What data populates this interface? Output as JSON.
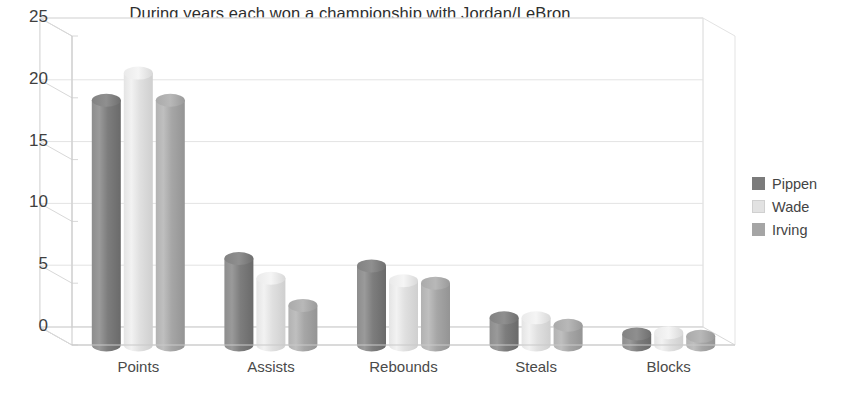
{
  "chart_data": {
    "type": "bar",
    "subtype": "3d-cylinder-clustered",
    "title": "During years each won a championship with Jordan/LeBron",
    "xlabel": "",
    "ylabel": "",
    "categories": [
      "Points",
      "Assists",
      "Rebounds",
      "Steals",
      "Blocks"
    ],
    "series": [
      {
        "name": "Pippen",
        "color": "#7b7b7b",
        "values": [
          19.8,
          7.0,
          6.4,
          2.2,
          0.9
        ]
      },
      {
        "name": "Wade",
        "color": "#e2e2e2",
        "values": [
          22.0,
          5.4,
          5.2,
          2.2,
          1.0
        ]
      },
      {
        "name": "Irving",
        "color": "#a5a5a5",
        "values": [
          19.8,
          3.2,
          5.0,
          1.6,
          0.7
        ]
      }
    ],
    "ylim": [
      0,
      25
    ],
    "yticks": [
      0,
      5,
      10,
      15,
      20,
      25
    ],
    "ytick_labels": [
      "0",
      "5",
      "10",
      "15",
      "20",
      "25"
    ],
    "grid": true,
    "grid_axis": "y",
    "legend_position": "right",
    "background": "#ffffff"
  },
  "legend": {
    "items": [
      {
        "label": "Pippen",
        "color": "#7b7b7b"
      },
      {
        "label": "Wade",
        "color": "#e2e2e2"
      },
      {
        "label": "Irving",
        "color": "#a5a5a5"
      }
    ]
  }
}
